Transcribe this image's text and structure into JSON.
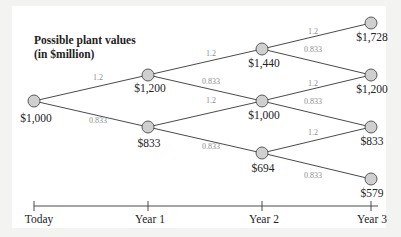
{
  "title": {
    "line1": "Possible plant values",
    "line2": "(in $million)"
  },
  "colors": {
    "node_fill": "#cfcfcf",
    "node_stroke": "#5a5a5a",
    "edge": "#4a4a4a",
    "factor_text": "#8d8d8d",
    "text": "#222222"
  },
  "nodes": {
    "today": "$1,000",
    "y1_up": "$1,200",
    "y1_down": "$833",
    "y2_uu": "$1,440",
    "y2_ud": "$1,000",
    "y2_dd": "$694",
    "y3_uuu": "$1,728",
    "y3_uud": "$1,200",
    "y3_udd": "$833",
    "y3_ddd": "$579"
  },
  "factors": {
    "up": "1.2",
    "down": "0.833"
  },
  "timeline": {
    "labels": [
      "Today",
      "Year 1",
      "Year 2",
      "Year 3"
    ]
  }
}
